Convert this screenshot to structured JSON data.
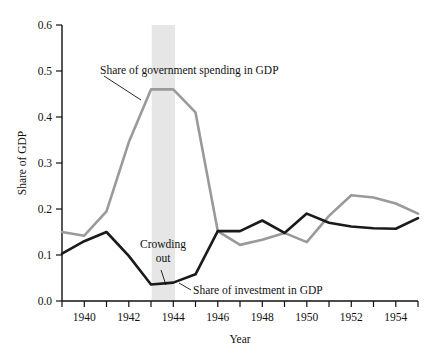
{
  "chart_data": {
    "type": "line",
    "title": "",
    "xlabel": "Year",
    "ylabel": "Share of GDP",
    "xlim": [
      1939,
      1955
    ],
    "ylim": [
      0.0,
      0.6
    ],
    "grid": false,
    "legend_position": "inline-annotations",
    "x": [
      1939,
      1940,
      1941,
      1942,
      1943,
      1944,
      1945,
      1946,
      1947,
      1948,
      1949,
      1950,
      1951,
      1952,
      1953,
      1954,
      1955
    ],
    "xticks": [
      1940,
      1942,
      1944,
      1946,
      1948,
      1950,
      1952,
      1954
    ],
    "xtick_labels": [
      "1940",
      "1942",
      "1944",
      "1946",
      "1948",
      "1950",
      "1952",
      "1954"
    ],
    "yticks": [
      0.0,
      0.1,
      0.2,
      0.3,
      0.4,
      0.5,
      0.6
    ],
    "ytick_labels": [
      "0.0",
      "0.1",
      "0.2",
      "0.3",
      "0.4",
      "0.5",
      "0.6"
    ],
    "series": [
      {
        "name": "Share of government spending in GDP",
        "color": "#9a9a9a",
        "values": [
          0.15,
          0.142,
          0.195,
          0.345,
          0.46,
          0.46,
          0.41,
          0.152,
          0.122,
          0.133,
          0.148,
          0.128,
          0.185,
          0.23,
          0.225,
          0.212,
          0.19
        ]
      },
      {
        "name": "Share of investment in GDP",
        "color": "#1a1a1a",
        "values": [
          0.103,
          0.13,
          0.15,
          0.098,
          0.036,
          0.04,
          0.058,
          0.152,
          0.152,
          0.175,
          0.148,
          0.19,
          0.17,
          0.162,
          0.158,
          0.157,
          0.18
        ]
      }
    ],
    "shaded_band": {
      "label": "Crowding out",
      "x_start": 1943,
      "x_end": 1944,
      "color": "#e6e6e6"
    },
    "annotations": [
      {
        "text": "Share of government spending in GDP",
        "x": 1940.7,
        "y": 0.505
      },
      {
        "text": "Crowding",
        "x": 1941.9,
        "y": 0.118
      },
      {
        "text": "out",
        "x": 1942.65,
        "y": 0.093
      },
      {
        "text": "Share of investment in GDP",
        "x": 1945.05,
        "y": 0.028
      }
    ]
  },
  "axes": {
    "y_title": "Share of GDP",
    "x_title": "Year"
  }
}
